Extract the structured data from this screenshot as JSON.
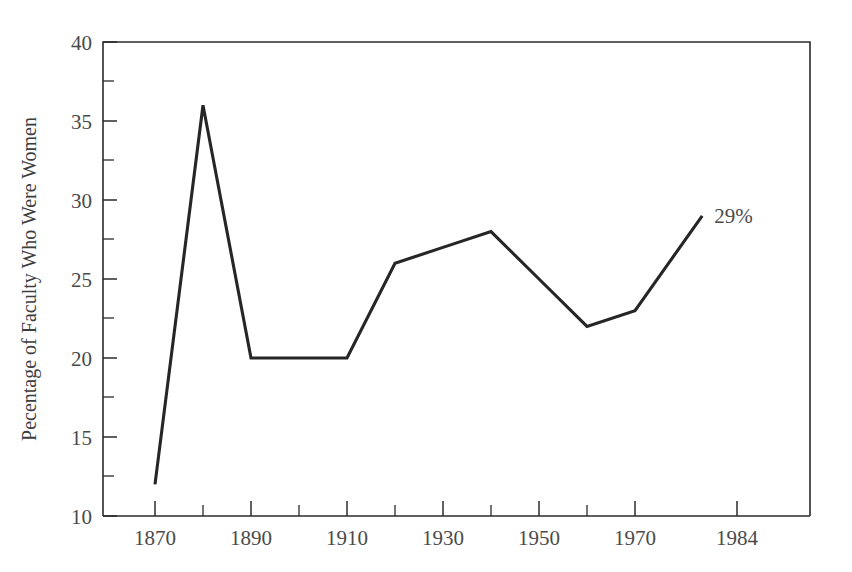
{
  "chart_data": {
    "type": "line",
    "title": "",
    "subtitle": "",
    "xlabel": "",
    "ylabel": "Pecentage of Faculty Who Were Women",
    "x": [
      1870,
      1880,
      1890,
      1900,
      1910,
      1920,
      1930,
      1940,
      1950,
      1960,
      1970,
      1984
    ],
    "values": [
      12,
      36,
      20,
      20,
      20,
      26,
      27,
      28,
      25,
      22,
      23,
      29
    ],
    "series": [
      {
        "name": "Pecentage of Faculty Who Were Women",
        "values": [
          12,
          36,
          20,
          20,
          20,
          26,
          27,
          28,
          25,
          22,
          23,
          29
        ]
      }
    ],
    "xlim": [
      1865,
      1999
    ],
    "ylim": [
      10,
      40
    ],
    "x_tick_labels": [
      "1870",
      "1890",
      "1910",
      "1930",
      "1950",
      "1970",
      "1984"
    ],
    "x_tick_values": [
      1870,
      1890,
      1910,
      1930,
      1950,
      1970,
      1984
    ],
    "x_minor_tick_values": [
      1880,
      1900,
      1920,
      1940,
      1960
    ],
    "y_tick_labels": [
      "10",
      "15",
      "20",
      "25",
      "30",
      "35",
      "40"
    ],
    "y_tick_values": [
      10,
      15,
      20,
      25,
      30,
      35,
      40
    ],
    "y_minor_tick_values": [
      12.5,
      17.5,
      22.5,
      27.5,
      32.5,
      37.5
    ],
    "grid": false,
    "legend": false,
    "legend_position": "none",
    "annotations": [
      {
        "text": "29%",
        "x": 1984,
        "y": 29
      }
    ],
    "colors": {
      "line": "#262626",
      "axis": "#2b2b2b",
      "text": "#4a4a4a",
      "background": "#ffffff"
    }
  }
}
